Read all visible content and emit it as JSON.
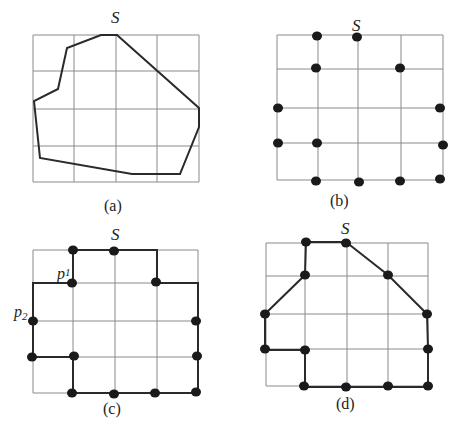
{
  "figure": {
    "panels": [
      {
        "id": "a",
        "caption": "(a)",
        "start_label": "S"
      },
      {
        "id": "b",
        "caption": "(b)",
        "start_label": "S"
      },
      {
        "id": "c",
        "caption": "(c)",
        "start_label": "S",
        "point_labels": [
          {
            "base": "p",
            "sub": "1"
          },
          {
            "base": "p",
            "sub": "2"
          }
        ]
      },
      {
        "id": "d",
        "caption": "(d)",
        "start_label": "S"
      }
    ]
  },
  "colors": {
    "grid": "#8a8a8a",
    "stroke": "#2a2a2a",
    "dot": "#1a1a1a"
  }
}
